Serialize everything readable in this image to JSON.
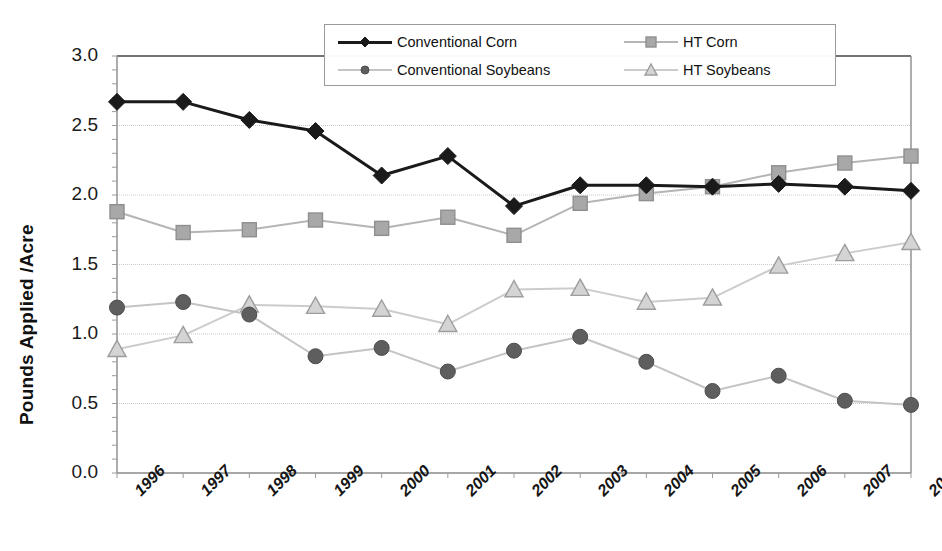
{
  "chart_data": {
    "type": "line",
    "title": "",
    "xlabel": "",
    "ylabel": "Pounds Applied /Acre",
    "categories": [
      "1996",
      "1997",
      "1998",
      "1999",
      "2000",
      "2001",
      "2002",
      "2003",
      "2004",
      "2005",
      "2006",
      "2007",
      "2008"
    ],
    "ylim": [
      0.0,
      3.0
    ],
    "yticks": [
      "0.0",
      "0.5",
      "1.0",
      "1.5",
      "2.0",
      "2.5",
      "3.0"
    ],
    "ytick_values": [
      0.0,
      0.5,
      1.0,
      1.5,
      2.0,
      2.5,
      3.0
    ],
    "grid": true,
    "legend_position": "top-center",
    "series": [
      {
        "name": "Conventional Corn",
        "marker": "diamond",
        "color": "#1a1a1a",
        "line_color": "#1a1a1a",
        "line_width": 3,
        "values": [
          2.67,
          2.67,
          2.54,
          2.46,
          2.14,
          2.28,
          1.92,
          2.07,
          2.07,
          2.06,
          2.08,
          2.06,
          2.03
        ]
      },
      {
        "name": "HT Corn",
        "marker": "square",
        "color": "#a8a8a8",
        "line_color": "#b5b5b5",
        "line_width": 2,
        "values": [
          1.88,
          1.73,
          1.75,
          1.82,
          1.76,
          1.84,
          1.71,
          1.94,
          2.01,
          2.06,
          2.16,
          2.23,
          2.28
        ]
      },
      {
        "name": "Conventional Soybeans",
        "marker": "circle",
        "color": "#5e5e5e",
        "line_color": "#c4c4c4",
        "line_width": 2,
        "values": [
          1.19,
          1.23,
          1.14,
          0.84,
          0.9,
          0.73,
          0.88,
          0.98,
          0.8,
          0.59,
          0.7,
          0.52,
          0.49
        ]
      },
      {
        "name": "HT Soybeans",
        "marker": "triangle",
        "color": "#d4d4d4",
        "line_color": "#cccccc",
        "line_width": 2,
        "values": [
          0.89,
          0.99,
          1.21,
          1.2,
          1.18,
          1.07,
          1.32,
          1.33,
          1.23,
          1.26,
          1.49,
          1.58,
          1.66
        ]
      }
    ]
  },
  "legend": {
    "items": [
      {
        "label": "Conventional Corn"
      },
      {
        "label": "HT Corn"
      },
      {
        "label": "Conventional Soybeans"
      },
      {
        "label": "HT Soybeans"
      }
    ]
  }
}
